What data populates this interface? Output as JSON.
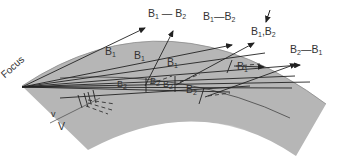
{
  "diagram": {
    "colors": {
      "band_fill": "#b4b4b4",
      "band_edge": "#8a8a8a",
      "ray": "#222222",
      "label": "#333333",
      "background": "#ffffff"
    },
    "labels": {
      "focus": "Focus",
      "top_b1_b2_left": {
        "a": "B",
        "a_sub": "1",
        "sep": " — ",
        "b": "B",
        "b_sub": "2"
      },
      "top_b1_b2_mid": {
        "a": "B",
        "a_sub": "1",
        "sep": "—",
        "b": "B",
        "b_sub": "2"
      },
      "top_b1_b2_comma": {
        "a": "B",
        "a_sub": "1",
        "sep": ",",
        "b": "B",
        "b_sub": "2"
      },
      "top_b2_b1_right": {
        "a": "B",
        "a_sub": "2",
        "sep": "—",
        "b": "B",
        "b_sub": "1"
      },
      "ray_b1_a": {
        "a": "B",
        "a_sub": "1"
      },
      "ray_b1_b": {
        "a": "B",
        "a_sub": "1"
      },
      "ray_b1_c": {
        "a": "B",
        "a_sub": "1"
      },
      "ray_b1_d": {
        "a": "B",
        "a_sub": "1"
      },
      "ray_b2_a": {
        "a": "B",
        "a_sub": "2"
      },
      "ray_b2_b": {
        "a": "B",
        "a_sub": "2"
      },
      "ray_b2_c": {
        "a": "B",
        "a_sub": "2"
      },
      "ray_b2_d": {
        "a": "B",
        "a_sub": "2"
      },
      "velocity_lower": "v",
      "velocity_upper": "V"
    }
  }
}
